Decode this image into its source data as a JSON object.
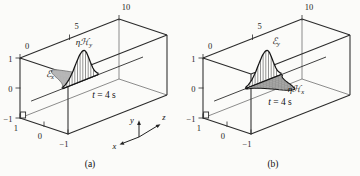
{
  "figure": {
    "background": "#fbfbf9",
    "line_color": "#2b2b2b",
    "gray_fill": "#cbcbcb",
    "triad": {
      "x": "x",
      "y": "y",
      "z": "z"
    },
    "panels": [
      {
        "id": "a",
        "caption": "(a)",
        "axis_z": {
          "ticks": [
            "0",
            "5",
            "10"
          ]
        },
        "axis_y": {
          "ticks": [
            "1",
            "0",
            "−1"
          ]
        },
        "axis_x": {
          "ticks": [
            "1",
            "0",
            "−1"
          ]
        },
        "time_label": {
          "var": "t",
          "rest": " = 4 s"
        },
        "pulses": [
          {
            "name": "e-field-pulse",
            "label_main": "ℰ",
            "label_sub": "x",
            "direction": "+x",
            "center_z": 4,
            "amplitude": 1,
            "style": "gray-filled"
          },
          {
            "name": "h-field-pulse",
            "label_main": "ηℋ",
            "label_sub": "y",
            "direction": "+y",
            "center_z": 4,
            "amplitude": 1,
            "style": "hatched"
          }
        ]
      },
      {
        "id": "b",
        "caption": "(b)",
        "axis_z": {
          "ticks": [
            "0",
            "5",
            "10"
          ]
        },
        "axis_y": {
          "ticks": [
            "1",
            "0",
            "−1"
          ]
        },
        "axis_x": {
          "ticks": [
            "1",
            "0",
            "−1"
          ]
        },
        "time_label": {
          "var": "t",
          "rest": " = 4 s"
        },
        "pulses": [
          {
            "name": "e-field-pulse",
            "label_main": "ℰ",
            "label_sub": "y",
            "direction": "+y",
            "center_z": 4,
            "amplitude": 1,
            "style": "hatched"
          },
          {
            "name": "h-field-pulse",
            "label_main": "ηℋ",
            "label_sub": "x",
            "direction": "-x",
            "center_z": 4,
            "amplitude": 1,
            "style": "hatched"
          }
        ]
      }
    ]
  }
}
